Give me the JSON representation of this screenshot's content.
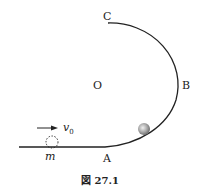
{
  "labels": {
    "C": "C",
    "O": "O",
    "B": "B",
    "A": "A",
    "v0": "v",
    "v0_sub": "0",
    "m": "m"
  },
  "caption": "図 27.1",
  "colors": {
    "track": "#222222",
    "ball": "#9a9a9a"
  }
}
